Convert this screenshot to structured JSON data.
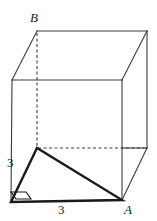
{
  "figure": {
    "stroke_color": "#3c3c3c",
    "bold_stroke_color": "#1a1a1a",
    "hidden_stroke_color": "#3c3c3c",
    "background": "#ffffff",
    "thin_width": 1.1,
    "bold_width": 2.4,
    "hidden_dash": "3,2.5"
  },
  "vertices": {
    "front_bottom_left": {
      "label": "",
      "x": 11,
      "y": 202
    },
    "front_bottom_right": {
      "label": "A",
      "x": 122,
      "y": 200
    },
    "front_top_left": {
      "label": "",
      "x": 12,
      "y": 80
    },
    "front_top_right": {
      "label": "",
      "x": 122,
      "y": 80
    },
    "back_bottom_left": {
      "label": "",
      "x": 37,
      "y": 148
    },
    "back_bottom_right": {
      "label": "",
      "x": 147,
      "y": 148
    },
    "back_top_left": {
      "label": "B",
      "x": 37,
      "y": 31
    },
    "back_top_right": {
      "label": "",
      "x": 147,
      "y": 31
    }
  },
  "labels": {
    "vertex_b": "B",
    "vertex_a": "A",
    "edge_vertical_length": "3",
    "edge_bottom_length": "3"
  },
  "triangle": {
    "name": "bold-right-triangle",
    "points": "11,202 37,148 122,200",
    "right_angle_at": "front_bottom_left",
    "legs": [
      "3",
      "3"
    ]
  },
  "right_angle_marker": {
    "name": "right-angle-marker",
    "points": "11,193 26,193 31,199 16,199"
  },
  "edges": {
    "visible": [
      {
        "name": "front-face-bottom",
        "x1": 11,
        "y1": 202,
        "x2": 122,
        "y2": 200
      },
      {
        "name": "front-face-left",
        "x1": 11,
        "y1": 202,
        "x2": 12,
        "y2": 80
      },
      {
        "name": "front-face-right",
        "x1": 122,
        "y1": 200,
        "x2": 122,
        "y2": 80
      },
      {
        "name": "front-face-top",
        "x1": 12,
        "y1": 80,
        "x2": 122,
        "y2": 80
      },
      {
        "name": "top-face-left-diagonal",
        "x1": 12,
        "y1": 80,
        "x2": 37,
        "y2": 31
      },
      {
        "name": "top-face-right-diagonal",
        "x1": 122,
        "y1": 80,
        "x2": 147,
        "y2": 31
      },
      {
        "name": "top-face-back",
        "x1": 37,
        "y1": 31,
        "x2": 147,
        "y2": 31
      },
      {
        "name": "right-face-bottom-diagonal",
        "x1": 122,
        "y1": 200,
        "x2": 147,
        "y2": 148
      },
      {
        "name": "back-right-vertical",
        "x1": 147,
        "y1": 148,
        "x2": 147,
        "y2": 31
      },
      {
        "name": "bottom-right-back-edge",
        "x1": 122,
        "y1": 148,
        "x2": 147,
        "y2": 148
      }
    ],
    "hidden": [
      {
        "name": "back-left-vertical-hidden",
        "x1": 37,
        "y1": 31,
        "x2": 37,
        "y2": 148
      },
      {
        "name": "bottom-back-horizontal-hidden",
        "x1": 37,
        "y1": 148,
        "x2": 147,
        "y2": 148
      }
    ]
  }
}
